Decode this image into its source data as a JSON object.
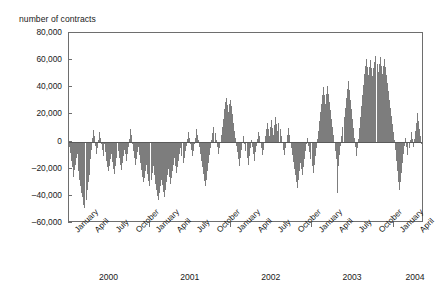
{
  "chart_data": {
    "type": "bar",
    "title": "",
    "ylabel": "number of contracts",
    "xlabel": "",
    "ylim": [
      -60000,
      80000
    ],
    "yticks": [
      -60000,
      -40000,
      -20000,
      0,
      20000,
      40000,
      60000,
      80000
    ],
    "ytick_labels": [
      "–60,000",
      "–40,000",
      "–20,000",
      "0",
      "20,000",
      "40,000",
      "60,000",
      "80,000"
    ],
    "grid": false,
    "legend": null,
    "bar_color": "#7d7d7d",
    "axis_color": "#6e6e6e",
    "month_ticks": [
      "January",
      "April",
      "July",
      "October",
      "January",
      "April",
      "July",
      "October",
      "January",
      "April",
      "July",
      "October",
      "January",
      "April",
      "July",
      "October",
      "January",
      "April"
    ],
    "year_labels": [
      "2000",
      "2001",
      "2002",
      "2003",
      "2004"
    ],
    "series_name": "net position change",
    "x_range_note": "daily observations, January 2000 through mid 2004",
    "values": [
      -4200,
      -8500,
      -14000,
      -19000,
      -26000,
      -21000,
      -17000,
      -12000,
      -9000,
      -22000,
      -28000,
      -33000,
      -38000,
      -41000,
      -47000,
      -49000,
      -43000,
      -36000,
      -30000,
      -25000,
      -13000,
      -6000,
      3000,
      8500,
      4000,
      -3000,
      -9000,
      -5000,
      1500,
      7000,
      3000,
      -2000,
      -6000,
      -11000,
      -2000,
      -8000,
      -14000,
      -19000,
      -22000,
      -18000,
      -13000,
      -9000,
      -15000,
      -20000,
      -24000,
      -18000,
      -12000,
      -7000,
      -12000,
      -17000,
      -21000,
      -16000,
      -11000,
      -6000,
      -9000,
      -14000,
      -9000,
      -4000,
      2000,
      9000,
      5000,
      -2000,
      -7000,
      -12000,
      -17000,
      -13000,
      -8000,
      -4000,
      -10000,
      -16000,
      -21000,
      -26000,
      -30000,
      -27000,
      -22000,
      -17000,
      -24000,
      -29000,
      -33000,
      -28000,
      -23000,
      -18000,
      -25000,
      -31000,
      -36000,
      -40000,
      -43000,
      -38000,
      -33000,
      -28000,
      -32000,
      -37000,
      -41000,
      -36000,
      -30000,
      -25000,
      -20000,
      -26000,
      -31000,
      -27000,
      -22000,
      -17000,
      -12000,
      -18000,
      -23000,
      -19000,
      -14000,
      -9000,
      -5000,
      -11000,
      -16000,
      -12000,
      -7000,
      -3000,
      2000,
      7000,
      3000,
      -2000,
      -6000,
      -11000,
      -7000,
      -2000,
      3000,
      9000,
      5000,
      1000,
      -4000,
      -9000,
      -14000,
      -19000,
      -24000,
      -29000,
      -33000,
      -28000,
      -22000,
      -16000,
      -10000,
      -5000,
      1000,
      6000,
      11000,
      6000,
      1000,
      -4000,
      -9000,
      -5000,
      0,
      5000,
      11000,
      17000,
      24000,
      29000,
      32000,
      27000,
      22000,
      28000,
      31000,
      26000,
      20000,
      14000,
      8000,
      3000,
      -3000,
      -8000,
      -13000,
      -18000,
      -12000,
      -6000,
      -1000,
      4000,
      -2000,
      -7000,
      -12000,
      -17000,
      -11000,
      -5000,
      1000,
      -4000,
      -9000,
      -14000,
      -8000,
      -3000,
      2000,
      7000,
      4000,
      -1000,
      -5000,
      -10000,
      -6000,
      -1000,
      4000,
      9000,
      14000,
      9000,
      4000,
      11000,
      16000,
      10000,
      5000,
      12000,
      18000,
      13000,
      8000,
      14000,
      9000,
      4000,
      -1000,
      -6000,
      -10000,
      -5000,
      0,
      5000,
      10000,
      5000,
      0,
      -5000,
      -10000,
      -15000,
      -20000,
      -25000,
      -30000,
      -34000,
      -28000,
      -22000,
      -16000,
      -20000,
      -25000,
      -19000,
      -13000,
      -7000,
      -2000,
      3000,
      -3000,
      -8000,
      -13000,
      -18000,
      -23000,
      -17000,
      -11000,
      -5000,
      2000,
      8000,
      15000,
      22000,
      28000,
      34000,
      40000,
      34000,
      28000,
      35000,
      41000,
      35000,
      29000,
      23000,
      17000,
      11000,
      5000,
      -1000,
      -7000,
      -13000,
      -38000,
      -18000,
      -10000,
      -3000,
      4000,
      11000,
      18000,
      25000,
      32000,
      39000,
      45000,
      38000,
      31000,
      24000,
      17000,
      10000,
      3000,
      -4000,
      -11000,
      -5000,
      2000,
      10000,
      18000,
      26000,
      34000,
      42000,
      50000,
      56000,
      61000,
      55000,
      49000,
      55000,
      60000,
      54000,
      48000,
      54000,
      59000,
      63000,
      57000,
      51000,
      57000,
      62000,
      56000,
      50000,
      56000,
      61000,
      55000,
      49000,
      43000,
      37000,
      31000,
      25000,
      19000,
      13000,
      7000,
      1000,
      -6000,
      -14000,
      -22000,
      -30000,
      -36000,
      -30000,
      -23000,
      -16000,
      -9000,
      -3000,
      3000,
      -4000,
      -10000,
      -5000,
      1000,
      7000,
      2000,
      -4000,
      2000,
      8000,
      14000,
      21000,
      15000,
      9000,
      4000,
      -2000,
      -7000,
      -3000
    ]
  }
}
